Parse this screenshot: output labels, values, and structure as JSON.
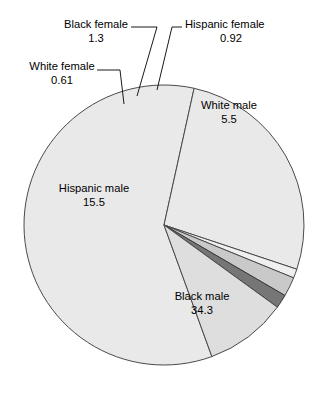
{
  "chart_data": {
    "type": "pie",
    "title": "",
    "subtitle": "",
    "xlabel": "",
    "ylabel": "",
    "legend_position": "none",
    "grid": false,
    "total": 58.13,
    "categories": [
      "Black male",
      "Hispanic male",
      "White male",
      "Black female",
      "Hispanic female",
      "White female"
    ],
    "values": [
      34.3,
      15.5,
      5.5,
      1.3,
      0.92,
      0.61
    ],
    "slices": [
      {
        "key": "black-male",
        "label": "Black male",
        "value": "34.3",
        "numeric": 34.3,
        "fill": "#e9e9e9",
        "stroke": "#4a4a4a",
        "label_placement": "inside"
      },
      {
        "key": "hispanic-male",
        "label": "Hispanic male",
        "value": "15.5",
        "numeric": 15.5,
        "fill": "#e9e9e9",
        "stroke": "#4a4a4a",
        "label_placement": "inside"
      },
      {
        "key": "white-male",
        "label": "White male",
        "value": "5.5",
        "numeric": 5.5,
        "fill": "#dedede",
        "stroke": "#4a4a4a",
        "label_placement": "inside"
      },
      {
        "key": "black-female",
        "label": "Black female",
        "value": "1.3",
        "numeric": 1.3,
        "fill": "#c9c9c9",
        "stroke": "#4a4a4a",
        "label_placement": "callout"
      },
      {
        "key": "hispanic-female",
        "label": "Hispanic female",
        "value": "0.92",
        "numeric": 0.92,
        "fill": "#767676",
        "stroke": "#3a3a3a",
        "label_placement": "callout"
      },
      {
        "key": "white-female",
        "label": "White female",
        "value": "0.61",
        "numeric": 0.61,
        "fill": "#efefef",
        "stroke": "#4a4a4a",
        "label_placement": "callout"
      }
    ]
  },
  "colors": {
    "background": "#ffffff",
    "text": "#000000",
    "leader_line": "#1a1a1a",
    "pie_outline": "#4a4a4a"
  }
}
